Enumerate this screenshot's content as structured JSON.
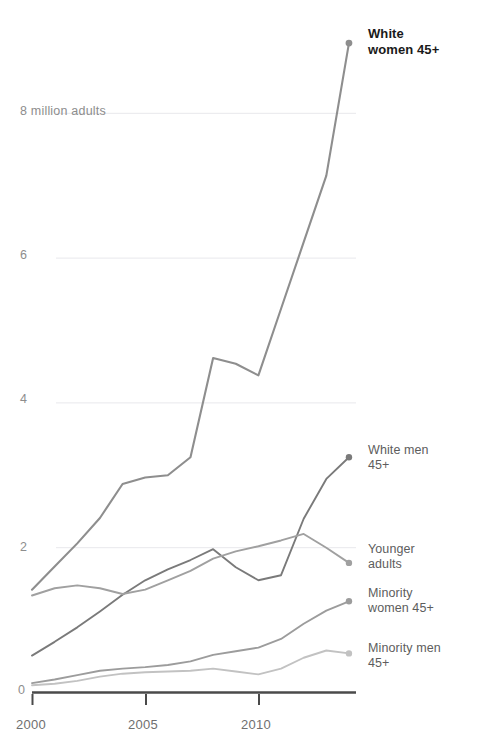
{
  "chart_data": {
    "type": "line",
    "title": "",
    "subtitle": "",
    "xlabel": "",
    "ylabel": "8 million adults",
    "x": [
      2000,
      2001,
      2002,
      2003,
      2004,
      2005,
      2006,
      2007,
      2008,
      2009,
      2010,
      2011,
      2012,
      2013,
      2014
    ],
    "xlim": [
      2000,
      2014.3
    ],
    "ylim": [
      0,
      8.3
    ],
    "y_ticks": [
      0,
      2,
      4,
      6,
      8
    ],
    "y_tick_labels": [
      "0",
      "2",
      "4",
      "6",
      "8 million adults"
    ],
    "x_ticks": [
      2000,
      2005,
      2010
    ],
    "x_tick_labels": [
      "2000",
      "2005",
      "2010"
    ],
    "grid": "horizontal-only, light gray, at 2 / 4 / 6 / 8",
    "legend": "inline end-of-line labels on the right",
    "axis_color": "#4a4a4a",
    "grid_color": "#e8e8ec",
    "series": [
      {
        "name": "White women 45+",
        "label": "White\nwomen 45+",
        "color": "#8e8e8e",
        "emphasis": true,
        "label_x": 368,
        "label_y": 26,
        "values": [
          1.42,
          1.74,
          2.06,
          2.41,
          2.88,
          2.97,
          3.0,
          3.25,
          4.62,
          4.54,
          4.38,
          5.3,
          6.22,
          7.14,
          8.97
        ]
      },
      {
        "name": "White men 45+",
        "label": "White men\n45+",
        "color": "#7a7a7a",
        "emphasis": false,
        "label_x": 368,
        "label_y": 443,
        "values": [
          0.51,
          0.7,
          0.9,
          1.12,
          1.35,
          1.55,
          1.7,
          1.83,
          1.98,
          1.73,
          1.55,
          1.62,
          2.4,
          2.95,
          3.25
        ]
      },
      {
        "name": "Younger adults",
        "label": "Younger\nadults",
        "color": "#a0a0a0",
        "emphasis": false,
        "label_x": 368,
        "label_y": 542,
        "values": [
          1.34,
          1.44,
          1.48,
          1.44,
          1.36,
          1.42,
          1.55,
          1.68,
          1.85,
          1.95,
          2.02,
          2.1,
          2.19,
          2.0,
          1.79
        ]
      },
      {
        "name": "Minority women 45+",
        "label": "Minority\nwomen 45+",
        "color": "#9c9c9c",
        "emphasis": false,
        "label_x": 368,
        "label_y": 586,
        "values": [
          0.13,
          0.18,
          0.24,
          0.3,
          0.33,
          0.35,
          0.38,
          0.43,
          0.52,
          0.57,
          0.62,
          0.74,
          0.95,
          1.13,
          1.26
        ]
      },
      {
        "name": "Minority men 45+",
        "label": "Minority men\n45+",
        "color": "#c2c2c2",
        "emphasis": false,
        "label_x": 368,
        "label_y": 641,
        "values": [
          0.1,
          0.12,
          0.16,
          0.22,
          0.26,
          0.28,
          0.29,
          0.3,
          0.33,
          0.29,
          0.25,
          0.33,
          0.48,
          0.58,
          0.54
        ]
      }
    ]
  },
  "axis": {
    "y_labels": [
      {
        "text": "8 million adults",
        "x": 20,
        "y": 104
      },
      {
        "text": "6",
        "x": 20,
        "y": 248
      },
      {
        "text": "4",
        "x": 20,
        "y": 392
      },
      {
        "text": "2",
        "x": 20,
        "y": 540
      },
      {
        "text": "0",
        "x": 18,
        "y": 683
      }
    ],
    "x_labels": [
      {
        "text": "2000",
        "x": 16,
        "y": 717
      },
      {
        "text": "2005",
        "x": 128,
        "y": 717
      },
      {
        "text": "2010",
        "x": 241,
        "y": 717
      }
    ]
  }
}
